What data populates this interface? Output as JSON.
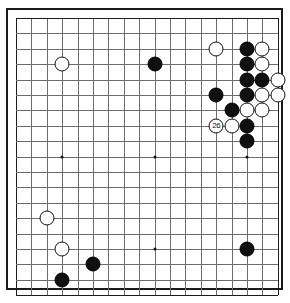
{
  "diagram": {
    "kind": "go-board-diagram",
    "caption": "",
    "board": {
      "columns": 18,
      "rows": 19,
      "line_color": "#6d6d6d",
      "edge_color": "#1c1c1c",
      "background_color": "#ffffff",
      "origin_x": 8,
      "origin_y": 8,
      "cell": 15.4,
      "stone_diameter": 15.0,
      "hoshi": [
        {
          "col": 4,
          "row": 4
        },
        {
          "col": 10,
          "row": 4
        },
        {
          "col": 16,
          "row": 4
        },
        {
          "col": 4,
          "row": 10
        },
        {
          "col": 10,
          "row": 10
        },
        {
          "col": 16,
          "row": 10
        },
        {
          "col": 4,
          "row": 16
        },
        {
          "col": 10,
          "row": 16
        },
        {
          "col": 16,
          "row": 16
        }
      ]
    },
    "stones": [
      {
        "col": 4,
        "row": 4,
        "color": "white",
        "label": ""
      },
      {
        "col": 10,
        "row": 4,
        "color": "black",
        "label": ""
      },
      {
        "col": 14,
        "row": 3,
        "color": "white",
        "label": ""
      },
      {
        "col": 16,
        "row": 3,
        "color": "black",
        "label": ""
      },
      {
        "col": 17,
        "row": 3,
        "color": "white",
        "label": ""
      },
      {
        "col": 16,
        "row": 4,
        "color": "black",
        "label": ""
      },
      {
        "col": 17,
        "row": 4,
        "color": "white",
        "label": ""
      },
      {
        "col": 16,
        "row": 5,
        "color": "black",
        "label": ""
      },
      {
        "col": 17,
        "row": 5,
        "color": "black",
        "label": ""
      },
      {
        "col": 18,
        "row": 5,
        "color": "white",
        "label": ""
      },
      {
        "col": 14,
        "row": 6,
        "color": "black",
        "label": ""
      },
      {
        "col": 16,
        "row": 6,
        "color": "black",
        "label": ""
      },
      {
        "col": 17,
        "row": 6,
        "color": "white",
        "label": ""
      },
      {
        "col": 18,
        "row": 6,
        "color": "white",
        "label": ""
      },
      {
        "col": 15,
        "row": 7,
        "color": "black",
        "label": ""
      },
      {
        "col": 16,
        "row": 7,
        "color": "white",
        "label": ""
      },
      {
        "col": 17,
        "row": 7,
        "color": "white",
        "label": ""
      },
      {
        "col": 14,
        "row": 8,
        "color": "white",
        "label": "26"
      },
      {
        "col": 15,
        "row": 8,
        "color": "white",
        "label": ""
      },
      {
        "col": 16,
        "row": 8,
        "color": "black",
        "label": ""
      },
      {
        "col": 16,
        "row": 9,
        "color": "black",
        "label": ""
      },
      {
        "col": 3,
        "row": 14,
        "color": "white",
        "label": ""
      },
      {
        "col": 4,
        "row": 16,
        "color": "white",
        "label": ""
      },
      {
        "col": 6,
        "row": 17,
        "color": "black",
        "label": ""
      },
      {
        "col": 4,
        "row": 18,
        "color": "black",
        "label": ""
      },
      {
        "col": 16,
        "row": 16,
        "color": "black",
        "label": ""
      }
    ]
  }
}
